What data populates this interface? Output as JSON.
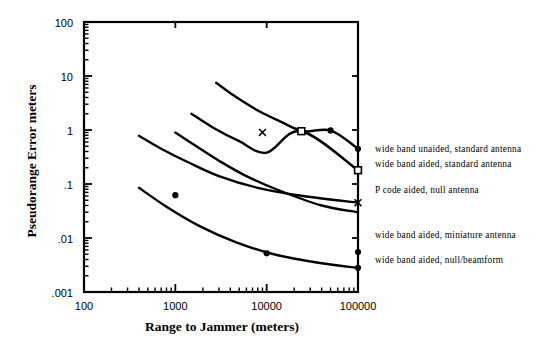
{
  "chart_data": {
    "type": "line",
    "title": "",
    "xlabel": "Range to Jammer (meters)",
    "ylabel": "Pseudorange Error meters",
    "xscale": "log",
    "yscale": "log",
    "xlim": [
      100,
      100000
    ],
    "ylim": [
      0.001,
      100
    ],
    "xticks": [
      100,
      1000,
      10000,
      100000
    ],
    "xticklabels": [
      "100",
      "1000",
      "10000",
      "100000"
    ],
    "yticks": [
      0.001,
      0.01,
      0.1,
      1,
      10,
      100
    ],
    "yticklabels": [
      ".001",
      ".01",
      ".1",
      "1",
      "10",
      "100"
    ],
    "grid": false,
    "minor_ticks": true,
    "legend_position": "right-inline-annotations",
    "series": [
      {
        "name": "wide band unaided, standard antenna",
        "marker": "filled-circle",
        "points": [
          {
            "x": 2800,
            "y": 7.5
          },
          {
            "x": 4500,
            "y": 4.2
          },
          {
            "x": 8000,
            "y": 2.3
          },
          {
            "x": 14000,
            "y": 1.45
          },
          {
            "x": 25000,
            "y": 0.95
          },
          {
            "x": 50000,
            "y": 0.98
          },
          {
            "x": 100000,
            "y": 0.45
          }
        ],
        "markers_at": [
          {
            "x": 50000,
            "y": 0.98
          },
          {
            "x": 100000,
            "y": 0.45
          }
        ]
      },
      {
        "name": "wide band aided, standard antenna",
        "marker": "open-square",
        "points": [
          {
            "x": 1500,
            "y": 2.0
          },
          {
            "x": 2600,
            "y": 1.1
          },
          {
            "x": 5000,
            "y": 0.62
          },
          {
            "x": 10000,
            "y": 0.38
          },
          {
            "x": 24000,
            "y": 0.95
          },
          {
            "x": 100000,
            "y": 0.18
          }
        ],
        "markers_at": [
          {
            "x": 24000,
            "y": 0.95
          },
          {
            "x": 100000,
            "y": 0.18
          }
        ]
      },
      {
        "name": "P code aided, null antenna",
        "marker": "x-cross",
        "points": [
          {
            "x": 400,
            "y": 0.78
          },
          {
            "x": 700,
            "y": 0.45
          },
          {
            "x": 1400,
            "y": 0.25
          },
          {
            "x": 3000,
            "y": 0.14
          },
          {
            "x": 8000,
            "y": 0.085
          },
          {
            "x": 25000,
            "y": 0.06
          },
          {
            "x": 100000,
            "y": 0.045
          }
        ],
        "markers_at": [
          {
            "x": 9000,
            "y": 0.9
          },
          {
            "x": 100000,
            "y": 0.045
          }
        ]
      },
      {
        "name": "wide band aided, miniature antenna",
        "marker": "filled-circle",
        "points": [
          {
            "x": 1000,
            "y": 0.9
          },
          {
            "x": 1700,
            "y": 0.5
          },
          {
            "x": 3000,
            "y": 0.27
          },
          {
            "x": 6000,
            "y": 0.14
          },
          {
            "x": 14000,
            "y": 0.075
          },
          {
            "x": 40000,
            "y": 0.04
          },
          {
            "x": 100000,
            "y": 0.03
          }
        ],
        "markers_at": [
          {
            "x": 1000,
            "y": 0.062
          },
          {
            "x": 100000,
            "y": 0.0055
          }
        ]
      },
      {
        "name": "wide band aided, null/beamform",
        "marker": "filled-circle",
        "points": [
          {
            "x": 400,
            "y": 0.085
          },
          {
            "x": 800,
            "y": 0.038
          },
          {
            "x": 1800,
            "y": 0.017
          },
          {
            "x": 4500,
            "y": 0.0085
          },
          {
            "x": 12000,
            "y": 0.005
          },
          {
            "x": 40000,
            "y": 0.0034
          },
          {
            "x": 100000,
            "y": 0.0028
          }
        ],
        "markers_at": [
          {
            "x": 10000,
            "y": 0.0052
          },
          {
            "x": 100000,
            "y": 0.0028
          }
        ]
      }
    ],
    "annotations": [
      {
        "text": "wide band unaided, standard antenna",
        "x": 375,
        "y": 152
      },
      {
        "text": "wide band aided, standard antenna",
        "x": 375,
        "y": 167
      },
      {
        "text": "P code aided, null antenna",
        "x": 375,
        "y": 193
      },
      {
        "text": "wide band aided, miniature antenna",
        "x": 375,
        "y": 238
      },
      {
        "text": "wide band aided, null/beamform",
        "x": 375,
        "y": 263
      }
    ]
  },
  "axes": {
    "y_label": "Pseudorange Error meters",
    "x_label": "Range to Jammer (meters)",
    "y_tick_labels": [
      "100",
      "10",
      "1",
      ".1",
      ".01",
      ".001"
    ],
    "x_tick_labels": [
      "100",
      "1000",
      "10000",
      "100000"
    ]
  },
  "colors": {
    "ink": "#000000",
    "background": "#ffffff"
  }
}
